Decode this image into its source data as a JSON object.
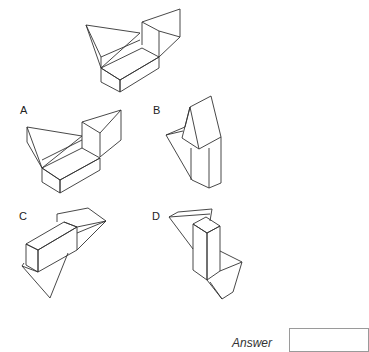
{
  "question": {
    "reference_figure": "3D block composed of a rectangular box with two triangular prisms",
    "options": [
      {
        "label": "A"
      },
      {
        "label": "B"
      },
      {
        "label": "C"
      },
      {
        "label": "D"
      }
    ]
  },
  "answer": {
    "label": "Answer",
    "value": ""
  }
}
